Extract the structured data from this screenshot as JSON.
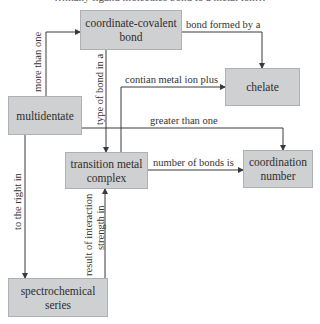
{
  "diagram": {
    "top_caption": "…many ligand molecules bond to a metal ion…",
    "nodes": {
      "coordinate_covalent_bond": {
        "line1": "coordinate-covalent",
        "line2": "bond"
      },
      "chelate": {
        "line1": "chelate"
      },
      "multidentate": {
        "line1": "multidentate"
      },
      "transition_metal_complex": {
        "line1": "transition metal",
        "line2": "complex"
      },
      "coordination_number": {
        "line1": "coordination",
        "line2": "number"
      },
      "spectrochemical_series": {
        "line1": "spectrochemical",
        "line2": "series"
      }
    },
    "edges": [
      {
        "from": "multidentate",
        "to": "coordinate_covalent_bond",
        "label": "more than one"
      },
      {
        "from": "coordinate_covalent_bond",
        "to": "chelate",
        "label": "bond formed by a"
      },
      {
        "from": "coordinate_covalent_bond",
        "to": "transition_metal_complex",
        "label": "type of bond in a"
      },
      {
        "from": "transition_metal_complex",
        "to": "chelate",
        "label": "contian metal ion plus"
      },
      {
        "from": "multidentate",
        "to": "coordination_number",
        "label": "greater than one"
      },
      {
        "from": "transition_metal_complex",
        "to": "coordination_number",
        "label": "number of bonds is"
      },
      {
        "from": "multidentate",
        "to": "spectrochemical_series",
        "label": "to the right in"
      },
      {
        "from": "spectrochemical_series",
        "to": "transition_metal_complex",
        "label_line1": "result of interaction",
        "label_line2": "strength in"
      }
    ],
    "colors": {
      "node_fill": "#cfd0d2",
      "node_border": "#aeb0b3",
      "line": "#3a3a3a",
      "text": "#2e2e2e"
    }
  }
}
